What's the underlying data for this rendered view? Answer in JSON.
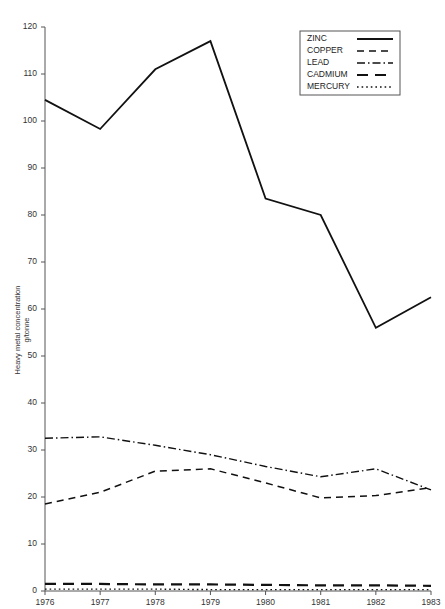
{
  "chart_data": {
    "type": "line",
    "title": "",
    "xlabel": "",
    "ylabel": "Heavy metal concentration g/tonne",
    "ylabel_line1": "Heavy metal concentration",
    "ylabel_line2": "g/tonne",
    "categories": [
      "1976",
      "1977",
      "1978",
      "1979",
      "1980",
      "1981",
      "1982",
      "1983"
    ],
    "x": [
      1976,
      1977,
      1978,
      1979,
      1980,
      1981,
      1982,
      1983
    ],
    "xlim": [
      1976,
      1983
    ],
    "ylim": [
      0,
      120
    ],
    "ytick_interval": 10,
    "yticks": [
      0,
      10,
      20,
      30,
      40,
      50,
      60,
      70,
      80,
      90,
      100,
      110,
      120
    ],
    "grid": false,
    "legend_position": "top-right",
    "series": [
      {
        "name": "ZINC",
        "dash": "solid",
        "color": "#111111",
        "values": [
          104.5,
          98.3,
          111.0,
          117.0,
          83.5,
          80.0,
          56.0,
          62.5
        ]
      },
      {
        "name": "COPPER",
        "dash": "dashed",
        "color": "#111111",
        "values": [
          18.5,
          21.0,
          25.5,
          26.0,
          23.0,
          19.8,
          20.3,
          22.0
        ]
      },
      {
        "name": "LEAD",
        "dash": "dash-dot",
        "color": "#111111",
        "values": [
          32.5,
          32.8,
          31.0,
          29.0,
          26.5,
          24.3,
          26.0,
          21.5
        ]
      },
      {
        "name": "CADMIUM",
        "dash": "long-dash",
        "color": "#111111",
        "values": [
          1.5,
          1.5,
          1.4,
          1.4,
          1.3,
          1.2,
          1.2,
          1.1
        ]
      },
      {
        "name": "MERCURY",
        "dash": "dotted",
        "color": "#111111",
        "values": [
          0.4,
          0.4,
          0.4,
          0.3,
          0.3,
          0.3,
          0.3,
          0.3
        ]
      }
    ]
  },
  "legend": {
    "entries": [
      {
        "label": "ZINC"
      },
      {
        "label": "COPPER"
      },
      {
        "label": "LEAD"
      },
      {
        "label": "CADMIUM"
      },
      {
        "label": "MERCURY"
      }
    ]
  }
}
